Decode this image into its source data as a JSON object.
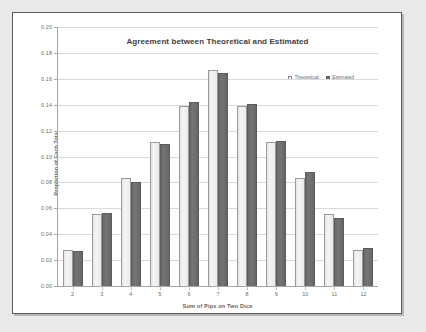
{
  "chart_data": {
    "type": "bar",
    "title": "Agreement between Theoretical and Estimated",
    "xlabel": "Sum of Pips on Two Dice",
    "ylabel": "Proportion of Each Total",
    "categories": [
      "2",
      "3",
      "4",
      "5",
      "6",
      "7",
      "8",
      "9",
      "10",
      "11",
      "12"
    ],
    "series": [
      {
        "name": "Theoretical",
        "color": "#efefef",
        "values": [
          0.0278,
          0.0556,
          0.0833,
          0.1111,
          0.1389,
          0.1667,
          0.1389,
          0.1111,
          0.0833,
          0.0556,
          0.0278
        ]
      },
      {
        "name": "Estimated",
        "color": "#6e6e6e",
        "values": [
          0.0268,
          0.0562,
          0.0805,
          0.1097,
          0.1424,
          0.1646,
          0.1402,
          0.1122,
          0.088,
          0.0525,
          0.0297
        ]
      }
    ],
    "ylim": [
      0.0,
      0.2
    ],
    "ytick_labels": [
      "0.00",
      "0.02",
      "0.04",
      "0.06",
      "0.08",
      "0.10",
      "0.12",
      "0.14",
      "0.16",
      "0.18",
      "0.20"
    ],
    "ytick_values": [
      0.0,
      0.02,
      0.04,
      0.06,
      0.08,
      0.1,
      0.12,
      0.14,
      0.16,
      0.18,
      0.2
    ],
    "grid": "horizontal",
    "legend_position": "top-right",
    "legend_entries": [
      "Theoretical",
      "Estimated"
    ]
  }
}
